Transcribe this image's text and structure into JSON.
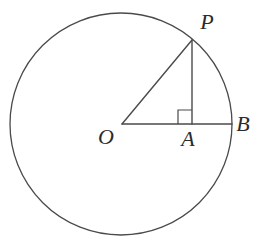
{
  "figure": {
    "canvas": {
      "width": 259,
      "height": 242
    },
    "style": {
      "background_color": "#ffffff",
      "stroke_color": "#4a4a4a",
      "label_color": "#2b2b2b",
      "circle_stroke_width": 1.3,
      "line_stroke_width": 1.4,
      "right_angle_stroke_width": 1.2
    },
    "circle": {
      "center_x": 121,
      "center_y": 124,
      "radius": 111,
      "fill": "none"
    },
    "points": {
      "O": {
        "x": 122,
        "y": 124,
        "role": "center"
      },
      "P": {
        "x": 192,
        "y": 40,
        "role": "on-circle"
      },
      "A": {
        "x": 192,
        "y": 124,
        "role": "foot-of-perpendicular"
      },
      "B": {
        "x": 232,
        "y": 124,
        "role": "on-circle"
      }
    },
    "segments": [
      {
        "name": "OB",
        "from": "O",
        "to": "B",
        "x1": 122,
        "y1": 124,
        "x2": 232,
        "y2": 124
      },
      {
        "name": "OP",
        "from": "O",
        "to": "P",
        "x1": 122,
        "y1": 124,
        "x2": 192,
        "y2": 40
      },
      {
        "name": "PA",
        "from": "P",
        "to": "A",
        "x1": 192,
        "y1": 40,
        "x2": 192,
        "y2": 124
      }
    ],
    "right_angle_marker": {
      "at_point": "A",
      "size": 14,
      "x": 178,
      "y": 110,
      "opens": "up-left"
    },
    "labels": [
      {
        "id": "P",
        "text": "P",
        "x": 207,
        "y": 22
      },
      {
        "id": "B",
        "text": "B",
        "x": 243,
        "y": 124
      },
      {
        "id": "A",
        "text": "A",
        "x": 188,
        "y": 139
      },
      {
        "id": "O",
        "text": "O",
        "x": 106,
        "y": 137
      }
    ]
  }
}
